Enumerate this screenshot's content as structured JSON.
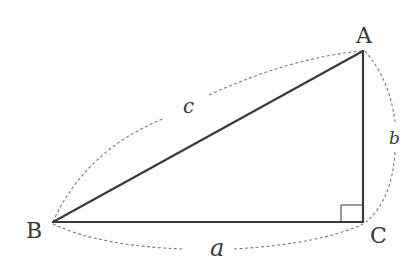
{
  "diagram": {
    "title": "",
    "type": "right-triangle",
    "colors": {
      "edge": "#3a3a3a",
      "arc": "#7a7a7a",
      "background": "#ffffff"
    },
    "vertices": [
      {
        "id": "A",
        "label": "A",
        "x": 363,
        "y": 51
      },
      {
        "id": "B",
        "label": "B",
        "x": 53,
        "y": 222
      },
      {
        "id": "C",
        "label": "C",
        "x": 363,
        "y": 222
      }
    ],
    "sides": [
      {
        "id": "a",
        "label": "a",
        "from": "B",
        "to": "C",
        "description": "base"
      },
      {
        "id": "b",
        "label": "b",
        "from": "C",
        "to": "A",
        "description": "vertical leg"
      },
      {
        "id": "c",
        "label": "c",
        "from": "B",
        "to": "A",
        "description": "hypotenuse"
      }
    ],
    "right_angle_at": "C"
  }
}
